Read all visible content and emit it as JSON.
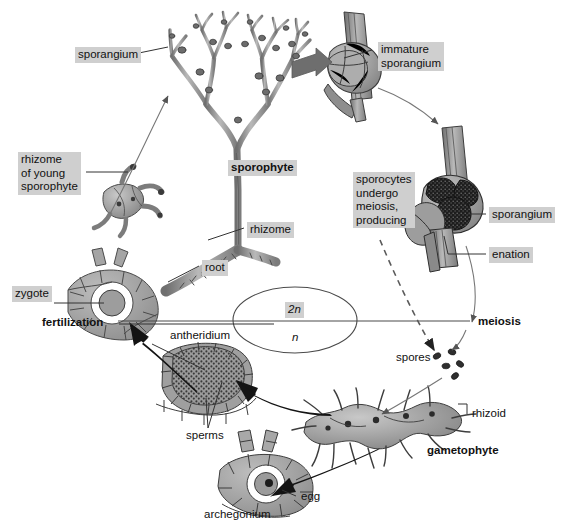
{
  "figure": {
    "type": "biological-life-cycle-diagram",
    "organism": "whisk fern (Psilotum)",
    "background_color": "#ffffff",
    "highlight_color": "#cfcfcf",
    "ink_color": "#111111",
    "structure_fill": "#9a9a9a",
    "structure_dark": "#2a2a2a"
  },
  "labels": {
    "sporangium_top": "sporangium",
    "rhizome_of_young_sporophyte": "rhizome\nof young\nsporophyte",
    "sporophyte": "sporophyte",
    "rhizome": "rhizome",
    "root": "root",
    "zygote": "zygote",
    "fertilization": "fertilization",
    "antheridium": "antheridium",
    "sperms": "sperms",
    "archegonium": "archegonium",
    "egg": "egg",
    "gametophyte": "gametophyte",
    "rhizoid": "rhizoid",
    "spores": "spores",
    "meiosis": "meiosis",
    "immature_sporangium": "immature\nsporangium",
    "sporocytes_note": "sporocytes\nundergo\nmeiosis,\nproducing",
    "sporangium_right": "sporangium",
    "enation": "enation",
    "ploidy_diploid": "2n",
    "ploidy_haploid": "n"
  }
}
